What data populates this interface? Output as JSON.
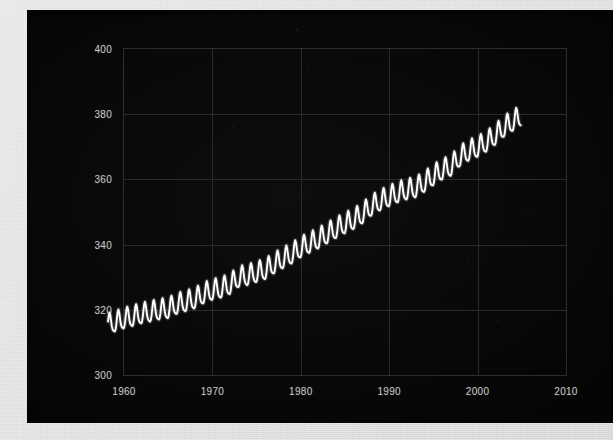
{
  "figure": {
    "background_color": "#050505",
    "surround_color": "#e4e4e2",
    "grid_color": "#2a2a2a",
    "line_color": "#ffffff",
    "tick_label_color": "#c9c9c9"
  },
  "chart_data": {
    "type": "line",
    "title": "",
    "subtitle": "",
    "xlabel": "",
    "ylabel": "",
    "xlim": [
      1960,
      2010
    ],
    "ylim": [
      300,
      400
    ],
    "grid": true,
    "legend": "none",
    "annotations": [],
    "xticks": [
      "1960",
      "1970",
      "1980",
      "1990",
      "2000",
      "2010"
    ],
    "xtick_values": [
      1960,
      1970,
      1980,
      1990,
      2000,
      2010
    ],
    "yticks": [
      "300",
      "320",
      "340",
      "360",
      "380",
      "400"
    ],
    "ytick_values": [
      300,
      320,
      340,
      360,
      380,
      400
    ],
    "series": [
      {
        "name": "Atmospheric CO2 concentration",
        "x_start": 1958.2,
        "x_end": 2004.9,
        "sampling": "monthly",
        "seasonal_amplitude_ppm": 3.1,
        "seasonal_peak_month": 5,
        "annual_mean": [
          {
            "year": 1959,
            "value": 315.97
          },
          {
            "year": 1960,
            "value": 316.91
          },
          {
            "year": 1961,
            "value": 317.64
          },
          {
            "year": 1962,
            "value": 318.45
          },
          {
            "year": 1963,
            "value": 318.99
          },
          {
            "year": 1964,
            "value": 319.62
          },
          {
            "year": 1965,
            "value": 320.04
          },
          {
            "year": 1966,
            "value": 321.38
          },
          {
            "year": 1967,
            "value": 322.16
          },
          {
            "year": 1968,
            "value": 323.04
          },
          {
            "year": 1969,
            "value": 324.62
          },
          {
            "year": 1970,
            "value": 325.68
          },
          {
            "year": 1971,
            "value": 326.32
          },
          {
            "year": 1972,
            "value": 327.45
          },
          {
            "year": 1973,
            "value": 329.68
          },
          {
            "year": 1974,
            "value": 330.18
          },
          {
            "year": 1975,
            "value": 331.11
          },
          {
            "year": 1976,
            "value": 332.04
          },
          {
            "year": 1977,
            "value": 333.83
          },
          {
            "year": 1978,
            "value": 335.4
          },
          {
            "year": 1979,
            "value": 336.84
          },
          {
            "year": 1980,
            "value": 338.75
          },
          {
            "year": 1981,
            "value": 340.11
          },
          {
            "year": 1982,
            "value": 341.45
          },
          {
            "year": 1983,
            "value": 343.05
          },
          {
            "year": 1984,
            "value": 344.65
          },
          {
            "year": 1985,
            "value": 346.12
          },
          {
            "year": 1986,
            "value": 347.42
          },
          {
            "year": 1987,
            "value": 349.19
          },
          {
            "year": 1988,
            "value": 351.57
          },
          {
            "year": 1989,
            "value": 353.12
          },
          {
            "year": 1990,
            "value": 354.39
          },
          {
            "year": 1991,
            "value": 355.61
          },
          {
            "year": 1992,
            "value": 356.45
          },
          {
            "year": 1993,
            "value": 357.1
          },
          {
            "year": 1994,
            "value": 358.83
          },
          {
            "year": 1995,
            "value": 360.82
          },
          {
            "year": 1996,
            "value": 362.61
          },
          {
            "year": 1997,
            "value": 363.73
          },
          {
            "year": 1998,
            "value": 366.7
          },
          {
            "year": 1999,
            "value": 368.38
          },
          {
            "year": 2000,
            "value": 369.55
          },
          {
            "year": 2001,
            "value": 371.14
          },
          {
            "year": 2002,
            "value": 373.28
          },
          {
            "year": 2003,
            "value": 375.8
          },
          {
            "year": 2004,
            "value": 377.52
          }
        ]
      }
    ]
  }
}
